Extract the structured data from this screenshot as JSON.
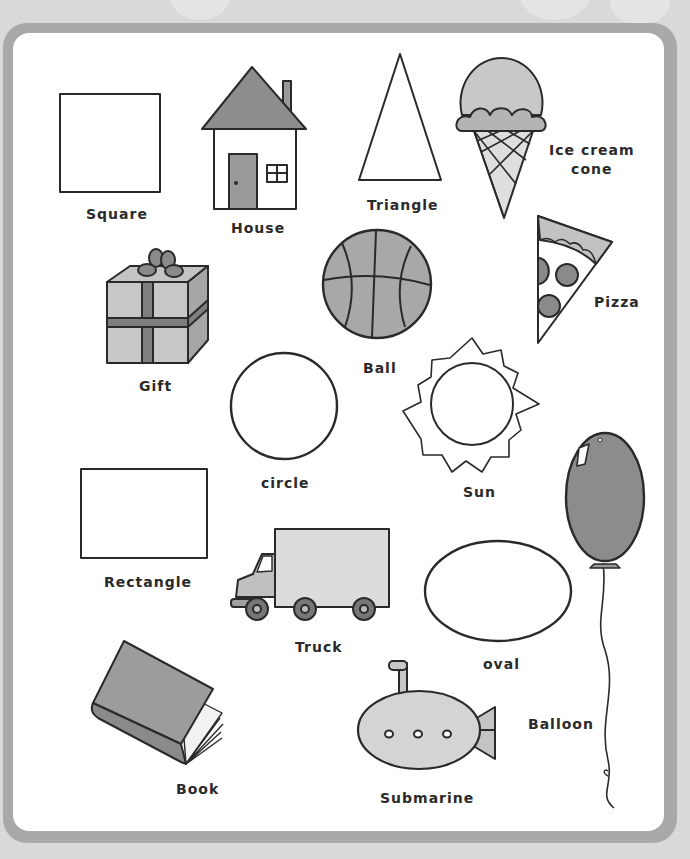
{
  "worksheet": {
    "items": [
      {
        "id": "square",
        "label": "Square"
      },
      {
        "id": "house",
        "label": "House"
      },
      {
        "id": "triangle",
        "label": "Triangle"
      },
      {
        "id": "ice-cream-cone",
        "label_line1": "Ice cream",
        "label_line2": "cone"
      },
      {
        "id": "gift",
        "label": "Gift"
      },
      {
        "id": "ball",
        "label": "Ball"
      },
      {
        "id": "pizza",
        "label": "Pizza"
      },
      {
        "id": "circle",
        "label": "circle"
      },
      {
        "id": "sun",
        "label": "Sun"
      },
      {
        "id": "rectangle",
        "label": "Rectangle"
      },
      {
        "id": "truck",
        "label": "Truck"
      },
      {
        "id": "oval",
        "label": "oval"
      },
      {
        "id": "balloon",
        "label": "Balloon"
      },
      {
        "id": "book",
        "label": "Book"
      },
      {
        "id": "submarine",
        "label": "Submarine"
      }
    ]
  },
  "colors": {
    "background": "#d9d9d9",
    "frame": "#a9a9a9",
    "panel": "#ffffff",
    "ink": "#2a2a2a",
    "shade_light": "#d4d4d4",
    "shade_mid": "#a8a8a8",
    "shade_dark": "#7c7c7c"
  }
}
